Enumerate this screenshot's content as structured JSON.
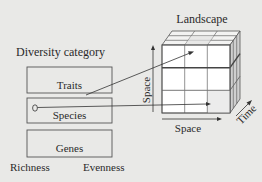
{
  "diagram": {
    "left": {
      "heading": "Diversity category",
      "boxes": [
        {
          "label": "Traits"
        },
        {
          "label": "Species"
        },
        {
          "label": "Genes"
        }
      ],
      "axis_labels": {
        "left": "Richness",
        "right": "Evenness"
      }
    },
    "right": {
      "title": "Landscape",
      "cube": {
        "grid": "3x3x3",
        "front_color": "#ffffff",
        "top_color": "#f2f2f2",
        "side_color": "#c9c9c9",
        "shaded_band_color": "#8a8a8a"
      },
      "axes": {
        "vertical": "Space",
        "horizontal": "Space",
        "depth": "Time"
      }
    },
    "connectors": [
      {
        "from": "Traits box (right edge)",
        "to": "Landscape cube top-middle cell",
        "arrow": true
      },
      {
        "from": "Species box marker",
        "to": "Landscape cube bottom-right cell",
        "arrow": true
      }
    ]
  }
}
